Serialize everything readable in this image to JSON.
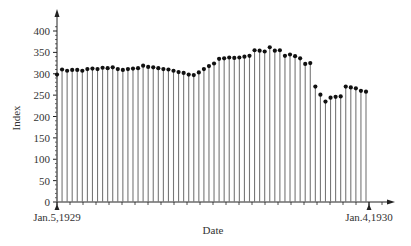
{
  "chart_data": {
    "type": "stem",
    "title": "",
    "xlabel": "Date",
    "ylabel": "Index",
    "ylim": [
      0,
      420
    ],
    "yticks": [
      0,
      50,
      100,
      150,
      200,
      250,
      300,
      350,
      400
    ],
    "x_start_label": "Jan.5,1929",
    "x_end_label": "Jan.4,1930",
    "grid": false,
    "legend": null,
    "series": [
      {
        "name": "Index",
        "values": [
          298,
          310,
          307,
          309,
          309,
          307,
          311,
          312,
          311,
          314,
          313,
          315,
          311,
          309,
          311,
          312,
          313,
          319,
          316,
          315,
          313,
          311,
          310,
          307,
          304,
          302,
          298,
          297,
          303,
          311,
          318,
          324,
          335,
          336,
          338,
          337,
          338,
          340,
          342,
          355,
          354,
          352,
          362,
          354,
          355,
          342,
          345,
          341,
          336,
          323,
          325,
          270,
          251,
          235,
          244,
          246,
          247,
          270,
          268,
          266,
          260,
          258
        ]
      }
    ]
  },
  "colors": {
    "stem": "#777777",
    "marker": "#111111",
    "axis": "#222222"
  }
}
